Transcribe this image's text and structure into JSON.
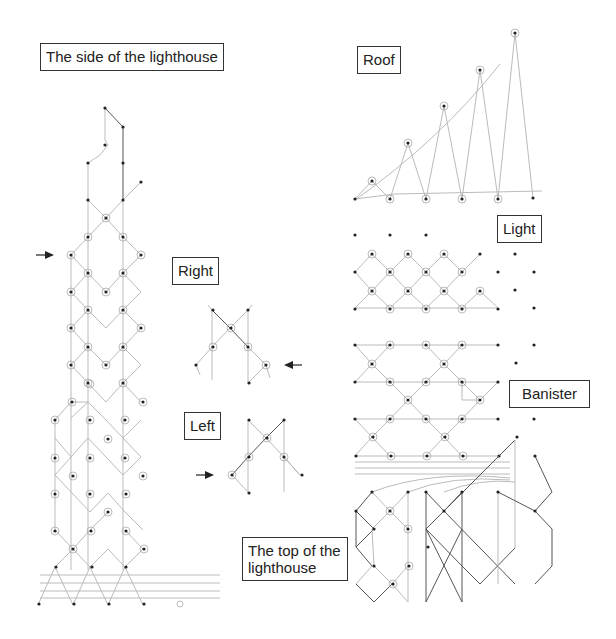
{
  "labels": {
    "side": "The side of the lighthouse",
    "roof": "Roof",
    "light": "Light",
    "right": "Right",
    "left": "Left",
    "banister": "Banister",
    "top": "The top of the lighthouse"
  },
  "arrows": {
    "side_arrow": "right-pointing-arrow",
    "right_arrow": "left-pointing-arrow",
    "left_arrow": "right-pointing-arrow"
  },
  "colors": {
    "thread": "#bbbbbb",
    "dark_thread": "#555555",
    "pin": "#222222",
    "border": "#333333"
  }
}
